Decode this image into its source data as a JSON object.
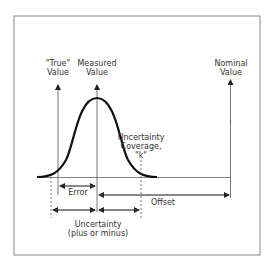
{
  "diagram": {
    "labels": {
      "true_value": [
        "\"True\"",
        "Value"
      ],
      "measured_value": [
        "Measured",
        "Value"
      ],
      "nominal_value": [
        "Nominal",
        "Value"
      ],
      "uncertainty_coverage": [
        "Uncertainty",
        "Coverage,",
        "\"k\""
      ],
      "error": "Error",
      "offset": "Offset",
      "uncertainty": [
        "Uncertainty",
        "(plus or minus)"
      ]
    },
    "colors": {
      "frame": "#888888",
      "line": "#555555",
      "curve": "#111111",
      "text": "#333333"
    }
  }
}
